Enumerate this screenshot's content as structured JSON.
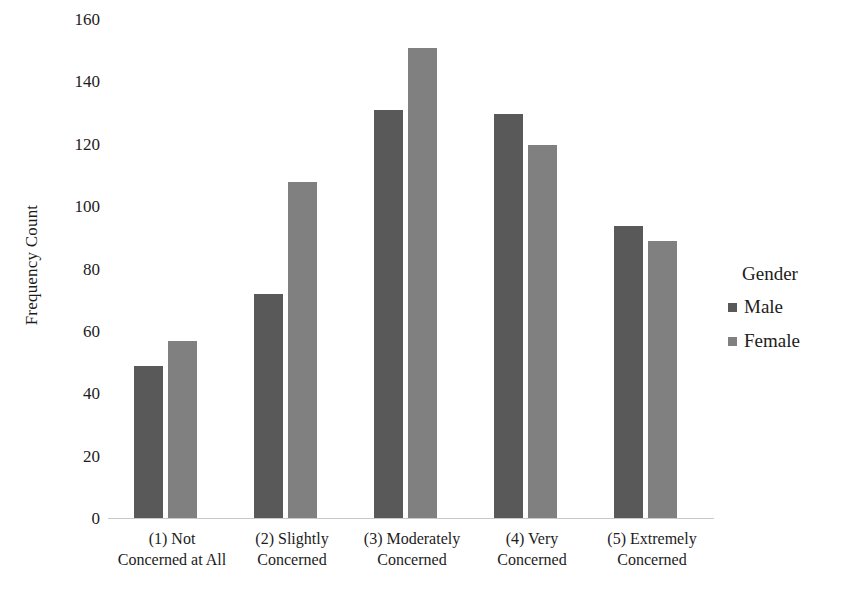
{
  "chart_data": {
    "type": "bar",
    "title": "",
    "xlabel": "",
    "ylabel": "Frequency Count",
    "ylim": [
      0,
      160
    ],
    "yticks": [
      0,
      20,
      40,
      60,
      80,
      100,
      120,
      140,
      160
    ],
    "grid": false,
    "legend_position": "right",
    "legend_title": "Gender",
    "categories": [
      "(1) Not\nConcerned at All",
      "(2) Slightly\nConcerned",
      "(3) Moderately\nConcerned",
      "(4) Very\nConcerned",
      "(5) Extremely\nConcerned"
    ],
    "category_lines": [
      [
        "(1) Not",
        "Concerned at All"
      ],
      [
        "(2) Slightly",
        "Concerned"
      ],
      [
        "(3) Moderately",
        "Concerned"
      ],
      [
        "(4) Very",
        "Concerned"
      ],
      [
        "(5) Extremely",
        "Concerned"
      ]
    ],
    "series": [
      {
        "name": "Male",
        "color": "#595959",
        "values": [
          49,
          72,
          131,
          130,
          94
        ]
      },
      {
        "name": "Female",
        "color": "#808080",
        "values": [
          57,
          108,
          151,
          120,
          89
        ]
      }
    ]
  },
  "axis": {
    "y_title": "Frequency Count",
    "y_tick_labels": [
      "160",
      "140",
      "120",
      "100",
      "80",
      "60",
      "40",
      "20",
      "0"
    ]
  },
  "legend": {
    "title": "Gender",
    "items": [
      {
        "label": "Male",
        "color": "#595959"
      },
      {
        "label": "Female",
        "color": "#808080"
      }
    ]
  },
  "colors": {
    "male": "#595959",
    "female": "#808080",
    "axis_line": "#c9c9c9",
    "text": "#1c1c1c",
    "background": "#ffffff"
  }
}
